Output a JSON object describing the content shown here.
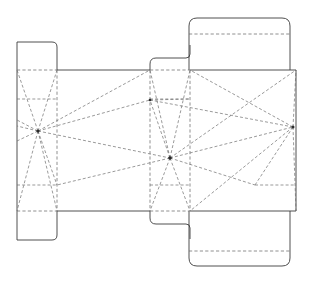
{
  "document": {
    "title": "Carton Dieline",
    "subject": "folding-carton-flat-blank",
    "view": "flat-unfolded-template"
  },
  "canvas": {
    "width": 314,
    "height": 282,
    "background": "#ffffff"
  },
  "style": {
    "cut_color": "#3c3c3c",
    "fold_color": "#6b6b6b",
    "crease_color": "#6e6e6e",
    "node_color": "#2b2b2b",
    "cut_width": 0.9,
    "fold_width": 0.75,
    "fold_dash": "3.2 2.2"
  },
  "geometry": {
    "body_top_y": 70,
    "body_bottom_y": 211,
    "body_left_x": 17,
    "body_right_x": 296,
    "panel_x": [
      17,
      57,
      150,
      190,
      296
    ],
    "fold_inner_top_y": 99,
    "fold_inner_bottom_y": 185
  },
  "nodes": [
    {
      "name": "left-convergence-node",
      "x": 38,
      "y": 131
    },
    {
      "name": "center-convergence-node",
      "x": 170,
      "y": 158
    },
    {
      "name": "right-convergence-node",
      "x": 293,
      "y": 127
    },
    {
      "name": "upper-crease-node",
      "x": 150,
      "y": 100
    }
  ],
  "panels": [
    {
      "name": "left-glue-tab",
      "label": "left glue tab"
    },
    {
      "name": "left-end-panel",
      "label": "left end panel"
    },
    {
      "name": "front-panel",
      "label": "front panel"
    },
    {
      "name": "right-end-panel",
      "label": "right end panel"
    },
    {
      "name": "back-panel",
      "label": "back panel"
    },
    {
      "name": "top-closure-flap",
      "label": "top closure flap"
    },
    {
      "name": "bottom-closure-flap",
      "label": "bottom closure flap"
    },
    {
      "name": "top-dust-tab",
      "label": "top dust tab"
    },
    {
      "name": "bottom-dust-tab",
      "label": "bottom dust tab"
    }
  ],
  "line_types": [
    {
      "name": "cut-line",
      "label": "cut line",
      "style": "solid"
    },
    {
      "name": "fold-line",
      "label": "fold / crease line",
      "style": "dashed"
    }
  ]
}
